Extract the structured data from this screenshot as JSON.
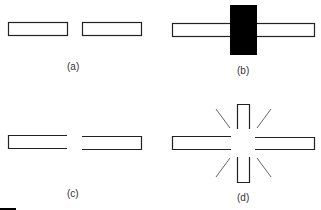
{
  "diagram": {
    "panels": [
      {
        "id": "a",
        "label": "(a)",
        "description": "two separate bars with a gap"
      },
      {
        "id": "b",
        "label": "(b)",
        "description": "bar with black block covering the center"
      },
      {
        "id": "c",
        "label": "(c)",
        "description": "two bars with open facing ends"
      },
      {
        "id": "d",
        "label": "(d)",
        "description": "cross of bars with radiating lines around gap"
      }
    ],
    "colors": {
      "stroke": "#222222",
      "fill": "#ffffff",
      "block": "#000000",
      "label": "#333333"
    }
  }
}
